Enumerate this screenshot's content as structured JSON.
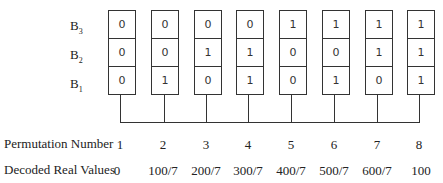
{
  "row_labels": [
    {
      "base": "B",
      "sub": "3"
    },
    {
      "base": "B",
      "sub": "2"
    },
    {
      "base": "B",
      "sub": "1"
    }
  ],
  "columns": [
    {
      "bits": [
        "0",
        "0",
        "0"
      ],
      "permutation": "1",
      "decoded": "0"
    },
    {
      "bits": [
        "0",
        "0",
        "1"
      ],
      "permutation": "2",
      "decoded": "100/7"
    },
    {
      "bits": [
        "0",
        "1",
        "0"
      ],
      "permutation": "3",
      "decoded": "200/7"
    },
    {
      "bits": [
        "0",
        "1",
        "1"
      ],
      "permutation": "4",
      "decoded": "300/7"
    },
    {
      "bits": [
        "1",
        "0",
        "0"
      ],
      "permutation": "5",
      "decoded": "400/7"
    },
    {
      "bits": [
        "1",
        "0",
        "1"
      ],
      "permutation": "6",
      "decoded": "500/7"
    },
    {
      "bits": [
        "1",
        "1",
        "0"
      ],
      "permutation": "7",
      "decoded": "600/7"
    },
    {
      "bits": [
        "1",
        "1",
        "1"
      ],
      "permutation": "8",
      "decoded": "100"
    }
  ],
  "labels": {
    "permutation_number": "Permutation Number",
    "decoded_real_values": "Decoded Real Values"
  }
}
